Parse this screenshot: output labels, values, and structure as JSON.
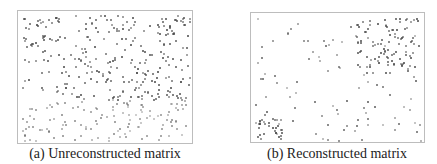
{
  "figure": {
    "panels": [
      {
        "id": "a",
        "caption": "(a) Unreconstructed matrix",
        "frame": {
          "x": 17,
          "y": 10,
          "w": 176,
          "h": 134
        },
        "caption_pos": {
          "x": 105,
          "y": 146
        },
        "pattern": "scattered",
        "seed": 7
      },
      {
        "id": "b",
        "caption": "(b) Reconstructed matrix",
        "frame": {
          "x": 250,
          "y": 12,
          "w": 175,
          "h": 131
        },
        "caption_pos": {
          "x": 337,
          "y": 146
        },
        "pattern": "clustered",
        "seed": 13
      }
    ],
    "dot_color": "#444444",
    "frame_color": "#bdbdbd"
  }
}
